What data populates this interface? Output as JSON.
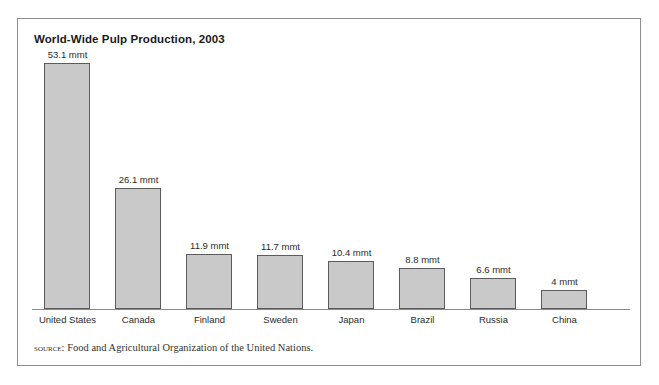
{
  "figure": {
    "title": "World-Wide Pulp Production, 2003",
    "source_label": "source:",
    "source_text": "Food and Agricultural Organization of the United Nations.",
    "border_color": "#8d8d8d",
    "background_color": "#ffffff"
  },
  "chart_data": {
    "type": "bar",
    "title": "World-Wide Pulp Production, 2003",
    "xlabel": "",
    "ylabel": "",
    "unit": "mmt",
    "grid": false,
    "legend": "none",
    "axis_visible": "x-baseline-only",
    "ylim": [
      0,
      53.1
    ],
    "categories": [
      "United States",
      "Canada",
      "Finland",
      "Sweden",
      "Japan",
      "Brazil",
      "Russia",
      "China"
    ],
    "values": [
      53.1,
      26.1,
      11.9,
      11.7,
      10.4,
      8.8,
      6.6,
      4
    ],
    "value_labels": [
      "53.1 mmt",
      "26.1 mmt",
      "11.9 mmt",
      "11.7 mmt",
      "10.4 mmt",
      "8.8 mmt",
      "6.6 mmt",
      "4 mmt"
    ],
    "bar_fill_color": "#c9c9c9",
    "bar_border_color": "#5b5b5b",
    "baseline_color": "#8a8a8a"
  }
}
